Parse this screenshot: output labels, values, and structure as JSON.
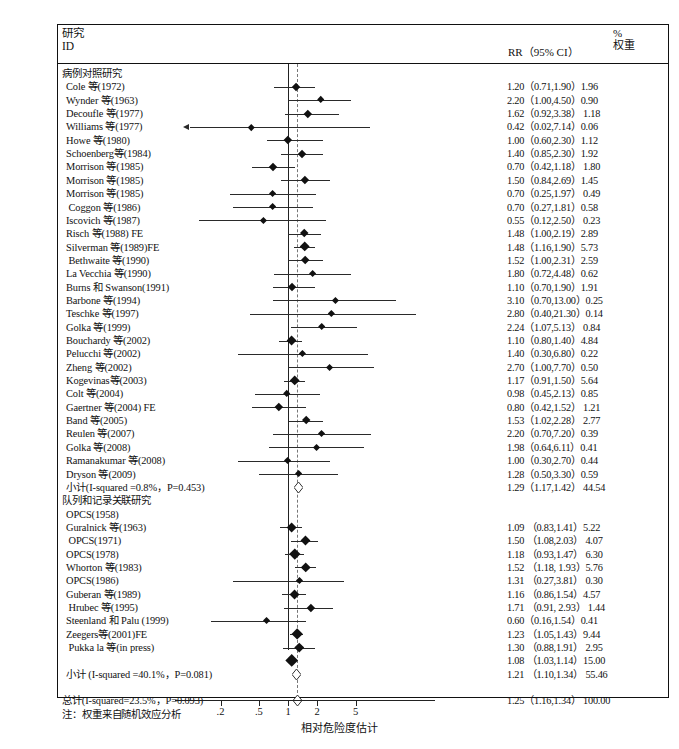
{
  "header": {
    "study_label_line1": "研究",
    "study_label_line2": "ID",
    "rr_label": "RR（95% CI）",
    "weight_line1": "%",
    "weight_line2": "权重"
  },
  "axis": {
    "xlabel": "相对危险度估计",
    "ticks": [
      "2",
      "5",
      "1",
      "2",
      "5"
    ],
    "tick_labels": [
      ".2",
      ".5",
      "1",
      "2",
      "5"
    ],
    "tick_values": [
      0.2,
      0.5,
      1,
      2,
      5
    ]
  },
  "footnote": "注：权重来自随机效应分析",
  "chart_data": {
    "type": "forest",
    "title": "",
    "xlabel": "相对危险度估计",
    "ylabel": "",
    "xscale": "log",
    "xlim": [
      0.15,
      6.5
    ],
    "null_line": 1.0,
    "pooled_line": 1.25,
    "grid": false,
    "columns": [
      "研究 ID",
      "RR（95% CI）",
      "% 权重"
    ],
    "rows": [
      {
        "kind": "group",
        "label": "病例对照研究"
      },
      {
        "kind": "study",
        "label": "Cole 等(1972)",
        "rr": 1.2,
        "lo": 0.71,
        "hi": 1.9,
        "weight": 1.96,
        "rr_text": "1.20（0.71,1.90）1.96"
      },
      {
        "kind": "study",
        "label": "Wynder 等(1963)",
        "rr": 2.2,
        "lo": 1.0,
        "hi": 4.5,
        "weight": 0.9,
        "rr_text": "2.20（1.00,4.50）0.90"
      },
      {
        "kind": "study",
        "label": "Decoufle 等(1977)",
        "rr": 1.62,
        "lo": 0.92,
        "hi": 3.38,
        "weight": 1.18,
        "rr_text": "1.62（0.92,3.38） 1.18"
      },
      {
        "kind": "study",
        "label": "Williams 等(1977)",
        "rr": 0.42,
        "lo": 0.02,
        "hi": 7.14,
        "weight": 0.06,
        "rr_text": "0.42（0.02,7.14）0.06",
        "left_arrow": true
      },
      {
        "kind": "study",
        "label": "Howe 等(1980)",
        "rr": 1.0,
        "lo": 0.6,
        "hi": 2.3,
        "weight": 1.12,
        "rr_text": "1.00（0.60,2.30）1.12"
      },
      {
        "kind": "study",
        "label": "Schoenberg等(1984)",
        "rr": 1.4,
        "lo": 0.85,
        "hi": 2.3,
        "weight": 1.92,
        "rr_text": "1.40（0.85,2.30）1.92"
      },
      {
        "kind": "study",
        "label": "Morrison 等(1985)",
        "rr": 0.7,
        "lo": 0.42,
        "hi": 1.18,
        "weight": 1.8,
        "rr_text": "0.70（0.42,1.18） 1.80"
      },
      {
        "kind": "study",
        "label": "Morrison 等(1985)",
        "rr": 1.5,
        "lo": 0.84,
        "hi": 2.69,
        "weight": 1.45,
        "rr_text": "1.50（0.84,2.69）1.45"
      },
      {
        "kind": "study",
        "label": "Morrison 等(1985)",
        "rr": 0.7,
        "lo": 0.25,
        "hi": 1.97,
        "weight": 0.49,
        "rr_text": "0.70（0.25,1.97） 0.49"
      },
      {
        "kind": "study",
        "label": " Coggon 等(1986)",
        "rr": 0.7,
        "lo": 0.27,
        "hi": 1.81,
        "weight": 0.58,
        "rr_text": "0.70（0.27,1.81）0.58"
      },
      {
        "kind": "study",
        "label": "Iscovich 等(1987)",
        "rr": 0.55,
        "lo": 0.12,
        "hi": 2.5,
        "weight": 0.23,
        "rr_text": "0.55（0.12,2.50） 0.23"
      },
      {
        "kind": "study",
        "label": "Risch 等(1988) FE",
        "rr": 1.48,
        "lo": 1.0,
        "hi": 2.19,
        "weight": 2.89,
        "rr_text": "1.48（1.00,2.19）2.89"
      },
      {
        "kind": "study",
        "label": "Silverman 等(1989)FE",
        "rr": 1.48,
        "lo": 1.16,
        "hi": 1.9,
        "weight": 5.73,
        "rr_text": "1.48（1.16,1.90）5.73"
      },
      {
        "kind": "study",
        "label": " Bethwaite 等(1990)",
        "rr": 1.52,
        "lo": 1.0,
        "hi": 2.31,
        "weight": 2.59,
        "rr_text": "1.52（1.00,2.31）2.59"
      },
      {
        "kind": "study",
        "label": "La Vecchia 等(1990)",
        "rr": 1.8,
        "lo": 0.72,
        "hi": 4.48,
        "weight": 0.62,
        "rr_text": "1.80（0.72,4.48）0.62"
      },
      {
        "kind": "study",
        "label": "Burns 和 Swanson(1991)",
        "rr": 1.1,
        "lo": 0.7,
        "hi": 1.9,
        "weight": 1.91,
        "rr_text": "1.10（0.70,1.90）1.91"
      },
      {
        "kind": "study",
        "label": "Barbone 等(1994)",
        "rr": 3.1,
        "lo": 0.7,
        "hi": 13.0,
        "weight": 0.25,
        "rr_text": "3.10（0.70,13.00）0.25"
      },
      {
        "kind": "study",
        "label": "Teschke 等(1997)",
        "rr": 2.8,
        "lo": 0.4,
        "hi": 21.3,
        "weight": 0.14,
        "rr_text": "2.80（0.40,21.30）0.14"
      },
      {
        "kind": "study",
        "label": "Golka 等(1999)",
        "rr": 2.24,
        "lo": 1.07,
        "hi": 5.13,
        "weight": 0.84,
        "rr_text": "2.24（1.07,5.13） 0.84"
      },
      {
        "kind": "study",
        "label": "Bouchardy 等(2002)",
        "rr": 1.1,
        "lo": 0.8,
        "hi": 1.4,
        "weight": 4.84,
        "rr_text": "1.10（0.80,1.40）4.84"
      },
      {
        "kind": "study",
        "label": "Pelucchi 等(2002)",
        "rr": 1.4,
        "lo": 0.3,
        "hi": 6.8,
        "weight": 0.22,
        "rr_text": "1.40（0.30,6.80）0.22"
      },
      {
        "kind": "study",
        "label": "Zheng 等(2002)",
        "rr": 2.7,
        "lo": 1.0,
        "hi": 7.7,
        "weight": 0.5,
        "rr_text": "2.70（1.00,7.70）0.50"
      },
      {
        "kind": "study",
        "label": "Kogevinas等(2003)",
        "rr": 1.17,
        "lo": 0.91,
        "hi": 1.5,
        "weight": 5.64,
        "rr_text": "1.17（0.91,1.50）5.64"
      },
      {
        "kind": "study",
        "label": "Colt 等(2004)",
        "rr": 0.98,
        "lo": 0.45,
        "hi": 2.13,
        "weight": 0.85,
        "rr_text": "0.98（0.45,2.13）0.85"
      },
      {
        "kind": "study",
        "label": "Gaertner 等(2004) FE",
        "rr": 0.8,
        "lo": 0.42,
        "hi": 1.52,
        "weight": 1.21,
        "rr_text": "0.80（0.42,1.52） 1.21"
      },
      {
        "kind": "study",
        "label": "Band 等(2005)",
        "rr": 1.53,
        "lo": 1.02,
        "hi": 2.28,
        "weight": 2.77,
        "rr_text": "1.53（1.02,2.28） 2.77"
      },
      {
        "kind": "study",
        "label": "Reulen 等(2007)",
        "rr": 2.2,
        "lo": 0.7,
        "hi": 7.2,
        "weight": 0.39,
        "rr_text": "2.20（0.70,7.20）0.39"
      },
      {
        "kind": "study",
        "label": "Golka 等(2008)",
        "rr": 1.98,
        "lo": 0.64,
        "hi": 6.11,
        "weight": 0.41,
        "rr_text": "1.98（0.64,6.11）0.41"
      },
      {
        "kind": "study",
        "label": "Ramanakumar 等(2008)",
        "rr": 1.0,
        "lo": 0.3,
        "hi": 2.7,
        "weight": 0.44,
        "rr_text": "1.00（0.30,2.70）0.44"
      },
      {
        "kind": "study",
        "label": "Dryson 等(2009)",
        "rr": 1.28,
        "lo": 0.5,
        "hi": 3.3,
        "weight": 0.59,
        "rr_text": "1.28（0.50,3.30）0.59"
      },
      {
        "kind": "subtotal",
        "label": "小计(I-squared =0.8%，P=0.453)",
        "rr": 1.29,
        "lo": 1.17,
        "hi": 1.42,
        "weight": 44.54,
        "rr_text": "1.29（1.17,1.42） 44.54"
      },
      {
        "kind": "group",
        "label": "队列和记录关联研究"
      },
      {
        "kind": "study",
        "label": "OPCS(1958)",
        "rr": null,
        "lo": null,
        "hi": null,
        "weight": null,
        "rr_text": ""
      },
      {
        "kind": "study",
        "label": "Guralnick 等(1963)",
        "rr": 1.09,
        "lo": 0.83,
        "hi": 1.41,
        "weight": 5.22,
        "rr_text": "1.09 （0.83,1.41）5.22"
      },
      {
        "kind": "study",
        "label": " OPCS(1971)",
        "rr": 1.5,
        "lo": 1.08,
        "hi": 2.03,
        "weight": 4.07,
        "rr_text": "1.50 （1.08,2.03） 4.07"
      },
      {
        "kind": "study",
        "label": "OPCS(1978)",
        "rr": 1.18,
        "lo": 0.93,
        "hi": 1.47,
        "weight": 6.3,
        "rr_text": "1.18 （0.93,1.47） 6.30"
      },
      {
        "kind": "study",
        "label": "Whorton 等(1983)",
        "rr": 1.52,
        "lo": 1.18,
        "hi": 1.93,
        "weight": 5.76,
        "rr_text": "1.52 （1.18, 1.93）5.76"
      },
      {
        "kind": "study",
        "label": "OPCS(1986)",
        "rr": 1.31,
        "lo": 0.27,
        "hi": 3.81,
        "weight": 0.3,
        "rr_text": "1.31 （0.27,3.81） 0.30"
      },
      {
        "kind": "study",
        "label": "Guberan 等(1989)",
        "rr": 1.16,
        "lo": 0.86,
        "hi": 1.54,
        "weight": 4.57,
        "rr_text": "1.16 （0.86,1.54）4.57"
      },
      {
        "kind": "study",
        "label": " Hrubec 等(1995)",
        "rr": 1.71,
        "lo": 0.91,
        "hi": 2.93,
        "weight": 1.44,
        "rr_text": "1.71 （0.91, 2.93） 1.44"
      },
      {
        "kind": "study",
        "label": "Steenland 和 Palu (1999)",
        "rr": 0.6,
        "lo": 0.16,
        "hi": 1.54,
        "weight": 0.41,
        "rr_text": "0.60（0.16,1.54）0.41"
      },
      {
        "kind": "study",
        "label": "Zeegers等(2001)FE",
        "rr": 1.23,
        "lo": 1.05,
        "hi": 1.43,
        "weight": 9.44,
        "rr_text": "1.23 （1.05,1.43）9.44"
      },
      {
        "kind": "study",
        "label": " Pukka la 等(in press)",
        "rr": 1.3,
        "lo": 0.88,
        "hi": 1.91,
        "weight": 2.95,
        "rr_text": "1.30 （0.88,1.91） 2.95"
      },
      {
        "kind": "study",
        "label": "",
        "rr": 1.08,
        "lo": 1.03,
        "hi": 1.14,
        "weight": 15.0,
        "rr_text": "1.08 （1.03,1.14）15.00"
      },
      {
        "kind": "subtotal",
        "label": "小计 (I-squared =40.1%，P=0.081)",
        "rr": 1.21,
        "lo": 1.1,
        "hi": 1.34,
        "weight": 55.46,
        "rr_text": "1.21 （1.10,1.34） 55.46"
      },
      {
        "kind": "blank",
        "label": ""
      },
      {
        "kind": "total",
        "label": "总计(I-squared=23.5%，P=0.093)",
        "rr": 1.25,
        "lo": 1.16,
        "hi": 1.34,
        "weight": 100.0,
        "rr_text": "1.25（1.16,1.34） 100.00"
      },
      {
        "kind": "note",
        "label": "注：权重来自随机效应分析"
      }
    ]
  }
}
